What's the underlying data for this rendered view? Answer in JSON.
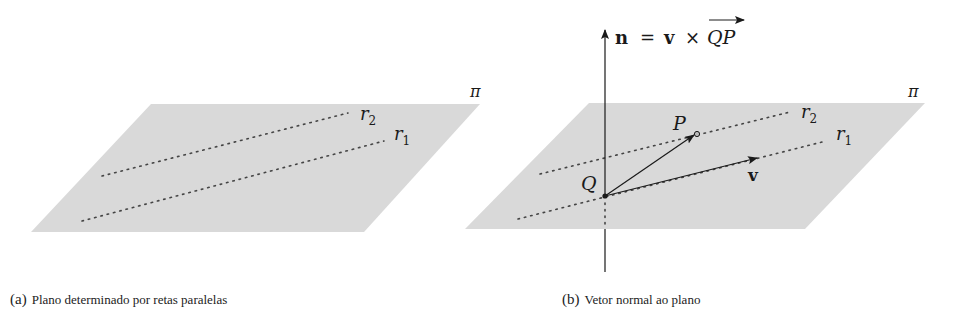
{
  "figure_a": {
    "plane_label": "π",
    "line_labels": {
      "r1": "r",
      "r1_sub": "1",
      "r2": "r",
      "r2_sub": "2"
    },
    "caption_tag": "(a)",
    "caption_text": "Plano determinado por retas paralelas"
  },
  "figure_b": {
    "plane_label": "π",
    "line_labels": {
      "r1": "r",
      "r1_sub": "1",
      "r2": "r",
      "r2_sub": "2"
    },
    "point_P": "P",
    "point_Q": "Q",
    "vector_v": "v",
    "normal_label": {
      "n": "n",
      "eq": "=",
      "v": "v",
      "times": "×",
      "QP": "QP"
    },
    "caption_tag": "(b)",
    "caption_text": "Vetor normal ao plano"
  },
  "colors": {
    "plane_fill": "#d9d9d9",
    "ink": "#1a1a1a",
    "dotted": "#444444"
  }
}
